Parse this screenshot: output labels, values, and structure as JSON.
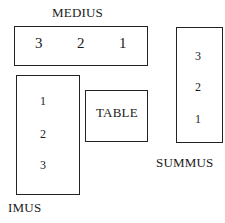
{
  "diagram": {
    "couches": [
      {
        "name": "MEDIUS",
        "positions": [
          "3",
          "2",
          "1"
        ]
      },
      {
        "name": "SUMMUS",
        "positions": [
          "3",
          "2",
          "1"
        ]
      },
      {
        "name": "IMUS",
        "positions": [
          "1",
          "2",
          "3"
        ]
      }
    ],
    "table_label": "TABLE"
  }
}
